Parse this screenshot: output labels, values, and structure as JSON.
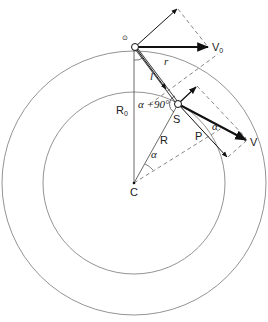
{
  "diagram": {
    "colors": {
      "line": "#555555",
      "bold": "#111111",
      "dashed": "#666666"
    },
    "labels": {
      "V0": "V",
      "V0_sub": "0",
      "V": "V",
      "r": "r",
      "l": "l",
      "R0": "R",
      "R0_sub": "0",
      "alpha_plus_90": "α +90°",
      "S": "S",
      "R": "R",
      "P": "P",
      "C": "C",
      "alpha_center": "α",
      "alpha_P": "α",
      "pivot_mark": "⊙"
    }
  }
}
